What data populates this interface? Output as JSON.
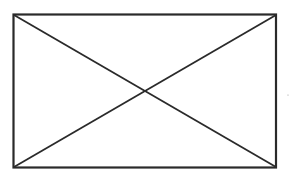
{
  "diagram": {
    "type": "rectangle-with-diagonals",
    "stroke_color": "#2a2a2a",
    "background": "#ffffff",
    "rectangle": {
      "x1": 13,
      "y1": 14,
      "x2": 276,
      "y2": 167
    },
    "diagonals": [
      {
        "from": "top-left",
        "to": "bottom-right"
      },
      {
        "from": "bottom-left",
        "to": "top-right"
      }
    ]
  }
}
